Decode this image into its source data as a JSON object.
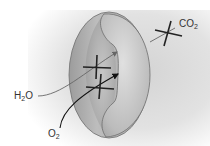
{
  "figure": {
    "labels": {
      "co2": {
        "main": "CO",
        "sub": "2"
      },
      "h2o": {
        "pre": "H",
        "sub": "2",
        "post": "O"
      },
      "o2": {
        "main": "O",
        "sub": "2"
      }
    },
    "colors": {
      "background_shade": "#d9d9d9",
      "cell_fill": "#b5b5b5",
      "cell_outline": "#6e6e6e",
      "cross_mark": "#222222",
      "arrow_h2o": "#555555",
      "arrow_o2": "#111111",
      "label_text": "#333333"
    }
  }
}
